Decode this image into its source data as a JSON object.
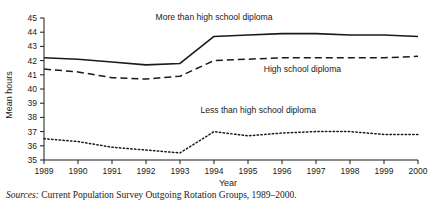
{
  "chart_data": {
    "type": "line",
    "title": "",
    "xlabel": "Year",
    "ylabel": "Mean hours",
    "categories": [
      1989,
      1990,
      1991,
      1992,
      1993,
      1994,
      1995,
      1996,
      1997,
      1998,
      1999,
      2000
    ],
    "xticklabels": [
      "1989",
      "1990",
      "1991",
      "1992",
      "1993",
      "1994",
      "1995",
      "1996",
      "1997",
      "1998",
      "1999",
      "2000"
    ],
    "yticks": [
      35,
      36,
      37,
      38,
      39,
      40,
      41,
      42,
      43,
      44,
      45
    ],
    "yticklabels": [
      "35",
      "36",
      "37",
      "38",
      "39",
      "40",
      "41",
      "42",
      "43",
      "44",
      "45"
    ],
    "ylim": [
      35,
      45
    ],
    "xlim": [
      1989,
      2000
    ],
    "grid": false,
    "legend_position": "inline-annotations",
    "series": [
      {
        "name": "More than high school diploma",
        "style": "solid",
        "color": "#1a1a1a",
        "values": [
          42.2,
          42.1,
          41.9,
          41.7,
          41.8,
          43.7,
          43.8,
          43.9,
          43.9,
          43.8,
          43.8,
          43.7
        ],
        "label_x": 1994.0,
        "label_y": 44.85
      },
      {
        "name": "High school diploma",
        "style": "dashed",
        "color": "#1a1a1a",
        "values": [
          41.4,
          41.2,
          40.8,
          40.7,
          40.9,
          42.0,
          42.1,
          42.2,
          42.2,
          42.2,
          42.2,
          42.3
        ],
        "label_x": 1996.6,
        "label_y": 41.2
      },
      {
        "name": "Less than high school diploma",
        "style": "dotted",
        "color": "#1a1a1a",
        "values": [
          36.5,
          36.3,
          35.9,
          35.7,
          35.5,
          37.0,
          36.7,
          36.9,
          37.0,
          37.0,
          36.8,
          36.8
        ],
        "label_x": 1995.3,
        "label_y": 38.3
      }
    ]
  },
  "footer": {
    "source_prefix": "Sources:",
    "source_text": "Current Population Survey Outgoing Rotation Groups, 1989–2000."
  }
}
